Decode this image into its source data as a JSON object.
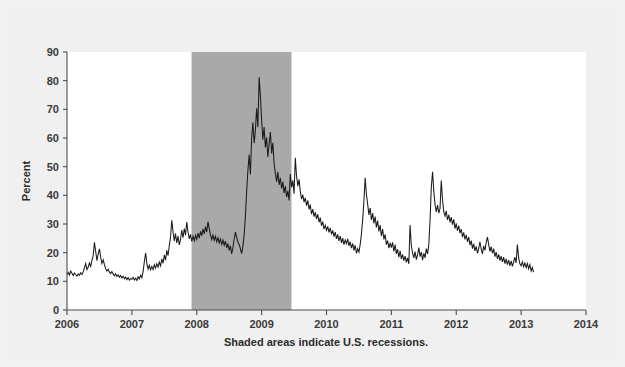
{
  "figure": {
    "background_color": "#f0f0f0",
    "page_background_color": "#f2f2f2",
    "plot_background_color": "#ffffff",
    "caption": "Shaded areas indicate U.S. recessions."
  },
  "chart_data": {
    "type": "line",
    "title": "",
    "subtitle": "",
    "xlabel": "",
    "ylabel": "Percent",
    "xlim": [
      2006.0,
      2014.0
    ],
    "ylim": [
      0,
      90
    ],
    "grid": false,
    "legend_position": "none",
    "annotations": [
      "Shaded areas indicate U.S. recessions."
    ],
    "x_ticks": [
      2006,
      2007,
      2008,
      2009,
      2010,
      2011,
      2012,
      2013,
      2014
    ],
    "x_tick_labels": [
      "2006",
      "2007",
      "2008",
      "2009",
      "2010",
      "2011",
      "2012",
      "2013",
      "2014"
    ],
    "y_ticks": [
      0,
      10,
      20,
      30,
      40,
      50,
      60,
      70,
      80,
      90
    ],
    "y_tick_labels": [
      "0",
      "10",
      "20",
      "30",
      "40",
      "50",
      "60",
      "70",
      "80",
      "90"
    ],
    "shaded_regions": [
      {
        "label": "U.S. recession",
        "x_start": 2007.92,
        "x_end": 2009.46,
        "color": "#a9a9a9"
      }
    ],
    "series": [
      {
        "name": "Percent",
        "color": "#1a1a1a",
        "x": [
          2006.0,
          2006.019,
          2006.038,
          2006.058,
          2006.077,
          2006.096,
          2006.115,
          2006.135,
          2006.154,
          2006.173,
          2006.192,
          2006.212,
          2006.231,
          2006.25,
          2006.269,
          2006.288,
          2006.308,
          2006.327,
          2006.346,
          2006.365,
          2006.385,
          2006.404,
          2006.423,
          2006.442,
          2006.462,
          2006.481,
          2006.5,
          2006.519,
          2006.538,
          2006.558,
          2006.577,
          2006.596,
          2006.615,
          2006.635,
          2006.654,
          2006.673,
          2006.692,
          2006.712,
          2006.731,
          2006.75,
          2006.769,
          2006.788,
          2006.808,
          2006.827,
          2006.846,
          2006.865,
          2006.885,
          2006.904,
          2006.923,
          2006.942,
          2006.962,
          2006.981,
          2007.0,
          2007.019,
          2007.038,
          2007.058,
          2007.077,
          2007.096,
          2007.115,
          2007.135,
          2007.154,
          2007.173,
          2007.192,
          2007.212,
          2007.231,
          2007.25,
          2007.269,
          2007.288,
          2007.308,
          2007.327,
          2007.346,
          2007.365,
          2007.385,
          2007.404,
          2007.423,
          2007.442,
          2007.462,
          2007.481,
          2007.5,
          2007.519,
          2007.538,
          2007.558,
          2007.577,
          2007.596,
          2007.615,
          2007.635,
          2007.654,
          2007.673,
          2007.692,
          2007.712,
          2007.731,
          2007.75,
          2007.769,
          2007.788,
          2007.808,
          2007.827,
          2007.846,
          2007.865,
          2007.885,
          2007.904,
          2007.923,
          2007.942,
          2007.962,
          2007.981,
          2008.0,
          2008.019,
          2008.038,
          2008.058,
          2008.077,
          2008.096,
          2008.115,
          2008.135,
          2008.154,
          2008.173,
          2008.192,
          2008.212,
          2008.231,
          2008.25,
          2008.269,
          2008.288,
          2008.308,
          2008.327,
          2008.346,
          2008.365,
          2008.385,
          2008.404,
          2008.423,
          2008.442,
          2008.462,
          2008.481,
          2008.5,
          2008.519,
          2008.538,
          2008.558,
          2008.577,
          2008.596,
          2008.615,
          2008.635,
          2008.654,
          2008.673,
          2008.692,
          2008.712,
          2008.731,
          2008.75,
          2008.769,
          2008.788,
          2008.808,
          2008.827,
          2008.846,
          2008.865,
          2008.885,
          2008.904,
          2008.923,
          2008.942,
          2008.962,
          2008.981,
          2009.0,
          2009.019,
          2009.038,
          2009.058,
          2009.077,
          2009.096,
          2009.115,
          2009.135,
          2009.154,
          2009.173,
          2009.192,
          2009.212,
          2009.231,
          2009.25,
          2009.269,
          2009.288,
          2009.308,
          2009.327,
          2009.346,
          2009.365,
          2009.385,
          2009.404,
          2009.423,
          2009.442,
          2009.462,
          2009.481,
          2009.5,
          2009.519,
          2009.538,
          2009.558,
          2009.577,
          2009.596,
          2009.615,
          2009.635,
          2009.654,
          2009.673,
          2009.692,
          2009.712,
          2009.731,
          2009.75,
          2009.769,
          2009.788,
          2009.808,
          2009.827,
          2009.846,
          2009.865,
          2009.885,
          2009.904,
          2009.923,
          2009.942,
          2009.962,
          2009.981,
          2010.0,
          2010.019,
          2010.038,
          2010.058,
          2010.077,
          2010.096,
          2010.115,
          2010.135,
          2010.154,
          2010.173,
          2010.192,
          2010.212,
          2010.231,
          2010.25,
          2010.269,
          2010.288,
          2010.308,
          2010.327,
          2010.346,
          2010.365,
          2010.385,
          2010.404,
          2010.423,
          2010.442,
          2010.462,
          2010.481,
          2010.5,
          2010.519,
          2010.538,
          2010.558,
          2010.577,
          2010.596,
          2010.615,
          2010.635,
          2010.654,
          2010.673,
          2010.692,
          2010.712,
          2010.731,
          2010.75,
          2010.769,
          2010.788,
          2010.808,
          2010.827,
          2010.846,
          2010.865,
          2010.885,
          2010.904,
          2010.923,
          2010.942,
          2010.962,
          2010.981,
          2011.0,
          2011.019,
          2011.038,
          2011.058,
          2011.077,
          2011.096,
          2011.115,
          2011.135,
          2011.154,
          2011.173,
          2011.192,
          2011.212,
          2011.231,
          2011.25,
          2011.269,
          2011.288,
          2011.308,
          2011.327,
          2011.346,
          2011.365,
          2011.385,
          2011.404,
          2011.423,
          2011.442,
          2011.462,
          2011.481,
          2011.5,
          2011.519,
          2011.538,
          2011.558,
          2011.577,
          2011.596,
          2011.615,
          2011.635,
          2011.654,
          2011.673,
          2011.692,
          2011.712,
          2011.731,
          2011.75,
          2011.769,
          2011.788,
          2011.808,
          2011.827,
          2011.846,
          2011.865,
          2011.885,
          2011.904,
          2011.923,
          2011.942,
          2011.962,
          2011.981,
          2012.0,
          2012.019,
          2012.038,
          2012.058,
          2012.077,
          2012.096,
          2012.115,
          2012.135,
          2012.154,
          2012.173,
          2012.192,
          2012.212,
          2012.231,
          2012.25,
          2012.269,
          2012.288,
          2012.308,
          2012.327,
          2012.346,
          2012.365,
          2012.385,
          2012.404,
          2012.423,
          2012.442,
          2012.462,
          2012.481,
          2012.5,
          2012.519,
          2012.538,
          2012.558,
          2012.577,
          2012.596,
          2012.615,
          2012.635,
          2012.654,
          2012.673,
          2012.692,
          2012.712,
          2012.731,
          2012.75,
          2012.769,
          2012.788,
          2012.808,
          2012.827,
          2012.846,
          2012.865,
          2012.885,
          2012.904,
          2012.923,
          2012.942,
          2012.962,
          2012.981,
          2013.0,
          2013.019,
          2013.038,
          2013.058,
          2013.077,
          2013.096,
          2013.115,
          2013.135,
          2013.154,
          2013.173,
          2013.192
        ],
        "values": [
          12.4,
          13.1,
          12.2,
          13.6,
          12.8,
          12.0,
          12.9,
          12.3,
          11.8,
          12.6,
          12.1,
          13.0,
          12.4,
          13.3,
          14.8,
          16.2,
          14.1,
          15.0,
          16.4,
          15.2,
          17.3,
          19.1,
          23.6,
          20.4,
          17.2,
          19.6,
          21.3,
          18.4,
          16.2,
          17.5,
          15.8,
          14.4,
          13.6,
          14.2,
          13.2,
          12.7,
          13.4,
          12.5,
          11.9,
          12.6,
          11.7,
          12.2,
          11.4,
          12.0,
          11.2,
          11.8,
          10.9,
          11.5,
          10.6,
          11.3,
          10.4,
          11.0,
          10.7,
          11.4,
          10.5,
          11.1,
          10.3,
          11.6,
          10.8,
          12.1,
          11.3,
          13.4,
          16.8,
          19.9,
          16.2,
          14.3,
          15.6,
          14.0,
          15.2,
          14.1,
          15.8,
          14.6,
          16.1,
          15.0,
          16.7,
          15.4,
          17.8,
          16.3,
          19.2,
          17.4,
          20.8,
          19.0,
          22.6,
          25.4,
          31.3,
          27.2,
          24.1,
          26.7,
          23.4,
          25.8,
          22.7,
          24.6,
          27.9,
          25.2,
          28.4,
          26.1,
          30.7,
          27.3,
          24.8,
          26.4,
          23.9,
          25.7,
          24.2,
          26.0,
          24.7,
          26.8,
          25.1,
          27.4,
          25.9,
          28.3,
          26.5,
          29.1,
          27.2,
          30.8,
          28.4,
          26.2,
          24.6,
          26.1,
          24.3,
          25.7,
          23.8,
          25.2,
          23.4,
          24.8,
          22.9,
          24.4,
          22.6,
          24.0,
          21.7,
          23.2,
          20.8,
          22.4,
          19.6,
          21.8,
          24.7,
          27.2,
          25.4,
          23.6,
          22.8,
          21.4,
          19.7,
          22.3,
          26.4,
          32.8,
          41.2,
          48.6,
          54.2,
          47.3,
          59.8,
          65.4,
          58.2,
          62.7,
          70.4,
          63.8,
          81.2,
          74.6,
          66.3,
          59.4,
          63.8,
          56.7,
          60.2,
          53.4,
          57.8,
          62.1,
          54.6,
          58.3,
          51.2,
          47.6,
          44.8,
          48.2,
          43.6,
          46.1,
          42.4,
          44.7,
          40.8,
          43.2,
          39.4,
          41.6,
          38.2,
          47.4,
          42.8,
          45.2,
          40.6,
          53.1,
          46.8,
          43.2,
          45.6,
          41.4,
          38.7,
          40.2,
          37.6,
          39.1,
          36.4,
          38.2,
          35.1,
          36.8,
          33.4,
          35.2,
          32.6,
          34.1,
          31.8,
          33.4,
          30.6,
          32.2,
          29.4,
          30.8,
          28.2,
          29.6,
          27.8,
          29.2,
          27.1,
          28.6,
          26.4,
          27.8,
          25.6,
          27.2,
          24.8,
          26.4,
          24.1,
          25.8,
          23.4,
          25.1,
          22.8,
          24.4,
          23.1,
          24.8,
          22.4,
          23.8,
          21.6,
          23.2,
          20.8,
          22.6,
          19.8,
          21.4,
          20.2,
          22.8,
          26.4,
          31.6,
          38.2,
          46.1,
          40.4,
          36.8,
          33.2,
          35.6,
          31.4,
          33.8,
          30.2,
          32.6,
          28.8,
          31.2,
          27.4,
          29.6,
          25.8,
          28.2,
          24.6,
          26.4,
          22.8,
          24.2,
          21.6,
          23.4,
          21.8,
          23.6,
          20.4,
          22.8,
          19.6,
          21.2,
          18.4,
          20.6,
          17.8,
          19.4,
          17.2,
          18.8,
          16.6,
          18.2,
          16.1,
          29.6,
          22.4,
          19.8,
          18.2,
          20.4,
          17.6,
          19.2,
          21.8,
          18.6,
          20.2,
          17.4,
          19.8,
          18.2,
          21.4,
          19.6,
          22.8,
          31.2,
          42.6,
          48.2,
          41.4,
          36.8,
          34.2,
          36.6,
          33.8,
          35.4,
          45.2,
          38.6,
          34.2,
          32.8,
          34.6,
          31.4,
          33.2,
          30.6,
          32.4,
          29.8,
          31.6,
          28.4,
          30.2,
          27.6,
          29.4,
          26.8,
          28.2,
          25.4,
          27.1,
          24.6,
          26.2,
          23.8,
          25.4,
          22.6,
          24.2,
          21.4,
          23.1,
          20.6,
          22.2,
          19.8,
          21.4,
          23.8,
          21.2,
          19.6,
          22.4,
          20.8,
          23.6,
          25.4,
          22.8,
          20.4,
          22.1,
          19.8,
          21.4,
          18.6,
          20.2,
          17.8,
          19.4,
          17.2,
          18.8,
          16.8,
          18.4,
          16.2,
          17.8,
          15.8,
          17.4,
          15.4,
          17.1,
          15.2,
          16.8,
          18.4,
          16.4,
          22.8,
          18.2,
          16.1,
          15.4,
          16.8,
          15.1,
          16.4,
          14.8,
          16.2,
          14.4,
          15.8,
          13.6,
          14.8,
          13.2
        ]
      }
    ]
  }
}
